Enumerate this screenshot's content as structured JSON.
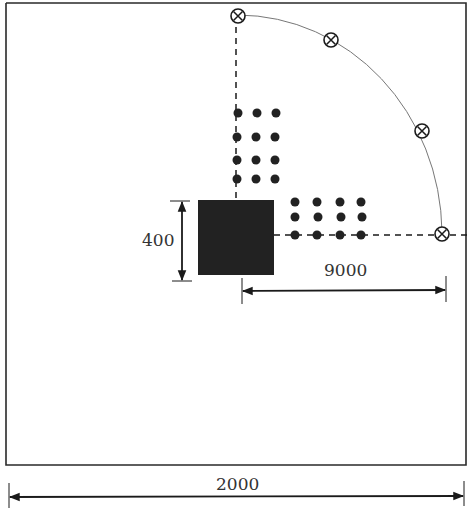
{
  "diagram": {
    "type": "layout-plan",
    "colors": {
      "ink": "#1a1a1a",
      "block": "#222222",
      "arc": "#777777",
      "background": "#ffffff"
    },
    "dimensions": {
      "height_label": "400",
      "radius_label": "9000",
      "width_label": "2000"
    },
    "elements": {
      "boundary": "rectangular room outline",
      "central_block": "solid black square",
      "vertical_dot_grid": {
        "rows": 4,
        "cols": 3
      },
      "horizontal_dot_grid": {
        "rows": 3,
        "cols": 4
      },
      "arc_markers": {
        "count": 5,
        "symbol": "circled-cross"
      }
    }
  }
}
